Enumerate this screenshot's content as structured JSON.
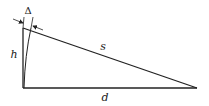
{
  "diagram": {
    "type": "right-triangle-geometry",
    "labels": {
      "height": "h",
      "hypotenuse": "s",
      "base": "d",
      "offset": "Δ"
    },
    "colors": {
      "stroke": "#222222",
      "background": "#ffffff"
    }
  }
}
